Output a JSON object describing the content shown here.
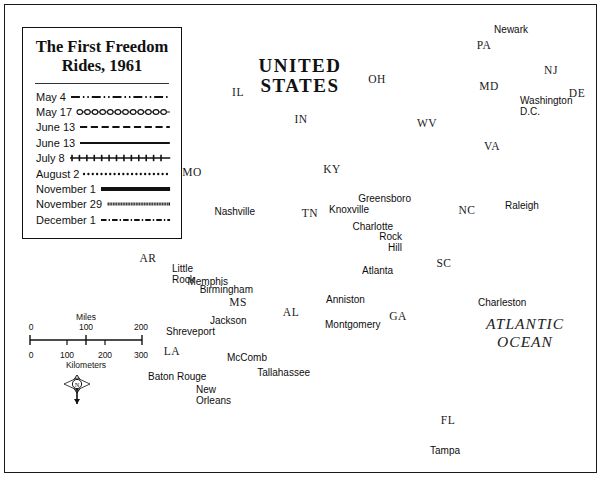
{
  "title": {
    "line1": "The First Freedom",
    "line2": "Rides, 1961"
  },
  "legend": {
    "entries": [
      {
        "label": "May 4",
        "style": "dash-dot-dot"
      },
      {
        "label": "May 17",
        "style": "circle-chain"
      },
      {
        "label": "June 13",
        "style": "dashed"
      },
      {
        "label": "June 13",
        "style": "solid"
      },
      {
        "label": "July 8",
        "style": "cross-hatch"
      },
      {
        "label": "August 2",
        "style": "dotted"
      },
      {
        "label": "November 1",
        "style": "thick-solid"
      },
      {
        "label": "November 29",
        "style": "dense-hatch"
      },
      {
        "label": "December 1",
        "style": "dash-dot"
      }
    ]
  },
  "scale": {
    "miles_caption": "Miles",
    "km_caption": "Kilometers",
    "miles_ticks": [
      "0",
      "100",
      "200"
    ],
    "km_ticks": [
      "0",
      "100",
      "200",
      "300"
    ]
  },
  "compass": {
    "north_letter": "N"
  },
  "country_label": {
    "line1": "UNITED",
    "line2": "STATES"
  },
  "ocean_label": {
    "line1": "ATLANTIC",
    "line2": "OCEAN"
  },
  "states": [
    {
      "abbr": "IL",
      "x": 238,
      "y": 93
    },
    {
      "abbr": "IN",
      "x": 301,
      "y": 120
    },
    {
      "abbr": "OH",
      "x": 377,
      "y": 80
    },
    {
      "abbr": "PA",
      "x": 484,
      "y": 46
    },
    {
      "abbr": "NJ",
      "x": 551,
      "y": 71
    },
    {
      "abbr": "DE",
      "x": 577,
      "y": 94
    },
    {
      "abbr": "MD",
      "x": 489,
      "y": 87
    },
    {
      "abbr": "WV",
      "x": 427,
      "y": 124
    },
    {
      "abbr": "VA",
      "x": 492,
      "y": 147
    },
    {
      "abbr": "KY",
      "x": 332,
      "y": 170
    },
    {
      "abbr": "TN",
      "x": 310,
      "y": 214
    },
    {
      "abbr": "NC",
      "x": 467,
      "y": 211
    },
    {
      "abbr": "SC",
      "x": 444,
      "y": 264
    },
    {
      "abbr": "GA",
      "x": 398,
      "y": 317
    },
    {
      "abbr": "AL",
      "x": 291,
      "y": 313
    },
    {
      "abbr": "MS",
      "x": 238,
      "y": 303
    },
    {
      "abbr": "LA",
      "x": 172,
      "y": 352
    },
    {
      "abbr": "AR",
      "x": 148,
      "y": 259
    },
    {
      "abbr": "MO",
      "x": 192,
      "y": 173
    },
    {
      "abbr": "FL",
      "x": 448,
      "y": 421
    }
  ],
  "cities": [
    {
      "name": "St.\nLouis",
      "lx": 173,
      "ly": 121,
      "dx": 220,
      "dy": 134,
      "anchor": "right"
    },
    {
      "name": "Nashville",
      "lx": 255,
      "ly": 207,
      "dx": 302,
      "dy": 211,
      "anchor": "right"
    },
    {
      "name": "Knoxville",
      "lx": 329,
      "ly": 205,
      "dx": 366,
      "dy": 211,
      "anchor": "left"
    },
    {
      "name": "Memphis",
      "lx": 228,
      "ly": 277,
      "dx": 264,
      "dy": 269,
      "anchor": "right"
    },
    {
      "name": "Little\nRock",
      "lx": 172,
      "ly": 264,
      "dx": 160,
      "dy": 259,
      "anchor": "left"
    },
    {
      "name": "Shreveport",
      "lx": 166,
      "ly": 327,
      "dx": 160,
      "dy": 324,
      "anchor": "left"
    },
    {
      "name": "Jackson",
      "lx": 210,
      "ly": 316,
      "dx": 227,
      "dy": 325,
      "anchor": "left"
    },
    {
      "name": "McComb",
      "lx": 227,
      "ly": 353,
      "dx": 224,
      "dy": 353,
      "anchor": "left"
    },
    {
      "name": "Baton Rouge",
      "lx": 148,
      "ly": 372,
      "dx": 204,
      "dy": 371,
      "anchor": "left"
    },
    {
      "name": "New\nOrleans",
      "lx": 196,
      "ly": 385,
      "dx": 218,
      "dy": 392,
      "anchor": "left"
    },
    {
      "name": "Birmingham",
      "lx": 253,
      "ly": 285,
      "dx": 308,
      "dy": 287,
      "anchor": "right"
    },
    {
      "name": "Montgomery",
      "lx": 325,
      "ly": 320,
      "dx": 319,
      "dy": 321,
      "anchor": "left"
    },
    {
      "name": "Anniston",
      "lx": 326,
      "ly": 295,
      "dx": 333,
      "dy": 288,
      "anchor": "left"
    },
    {
      "name": "Atlanta",
      "lx": 362,
      "ly": 266,
      "dx": 368,
      "dy": 276,
      "anchor": "left"
    },
    {
      "name": "Tallahassee",
      "lx": 310,
      "ly": 368,
      "dx": 371,
      "dy": 372,
      "anchor": "right"
    },
    {
      "name": "Tampa",
      "lx": 430,
      "ly": 446,
      "dx": 426,
      "dy": 446,
      "anchor": "left"
    },
    {
      "name": "Charleston",
      "lx": 478,
      "ly": 298,
      "dx": 474,
      "dy": 295,
      "anchor": "left"
    },
    {
      "name": "Charlotte",
      "lx": 393,
      "ly": 222,
      "dx": 447,
      "dy": 223,
      "anchor": "right"
    },
    {
      "name": "Rock\nHill",
      "lx": 402,
      "ly": 232,
      "dx": 444,
      "dy": 234,
      "anchor": "right"
    },
    {
      "name": "Greensboro",
      "lx": 411,
      "ly": 194,
      "dx": 464,
      "dy": 196,
      "anchor": "right"
    },
    {
      "name": "Raleigh",
      "lx": 505,
      "ly": 201,
      "dx": 500,
      "dy": 199,
      "anchor": "left"
    },
    {
      "name": "Newark",
      "lx": 528,
      "ly": 25,
      "dx": 563,
      "dy": 31,
      "anchor": "right"
    },
    {
      "name": "Washington\nD.C.",
      "lx": 520,
      "ly": 96,
      "dx": 511,
      "dy": 100,
      "anchor": "left"
    }
  ],
  "colors": {
    "ocean": "#d6d6d6",
    "land": "#ffffff",
    "border": "#9a9a9a",
    "route": "#111111",
    "frame": "#1a1a1a"
  }
}
